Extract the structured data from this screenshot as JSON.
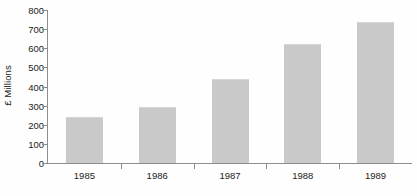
{
  "chart_data": {
    "type": "bar",
    "title": "",
    "subtitle": "",
    "xlabel": "",
    "ylabel": "£ Millions",
    "categories": [
      "1985",
      "1986",
      "1987",
      "1988",
      "1989"
    ],
    "values": [
      240,
      295,
      440,
      620,
      735
    ],
    "series": [
      {
        "name": "",
        "values": [
          240,
          295,
          440,
          620,
          735
        ]
      }
    ],
    "ylim": [
      0,
      800
    ],
    "y_ticks": [
      0,
      100,
      200,
      300,
      400,
      500,
      600,
      700,
      800
    ],
    "y_tick_labels": [
      "0",
      "100",
      "200",
      "300",
      "400",
      "500",
      "600",
      "700",
      "800"
    ],
    "grid": false,
    "legend": false,
    "legend_position": "none",
    "bar_color": "#c9c9c9",
    "axis_color": "#8d8d8d",
    "text_color": "#1c1c1c",
    "background_color": "#ffffff",
    "annotations": []
  }
}
